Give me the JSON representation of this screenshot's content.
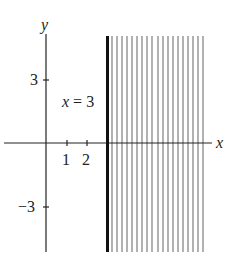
{
  "figure": {
    "axis_labels": {
      "x": "x",
      "y": "y"
    },
    "x_ticks": [
      {
        "value": 1,
        "label": "1"
      },
      {
        "value": 2,
        "label": "2"
      }
    ],
    "y_ticks": [
      {
        "value": 3,
        "label": "3"
      },
      {
        "value": -3,
        "label": "−3"
      }
    ],
    "boundary_line": {
      "equation_label": "x = 3",
      "x_value": 3,
      "style": "solid-thick"
    },
    "shaded_region": {
      "description": "x >= 3",
      "hatch": "vertical-lines",
      "line_count": 19
    },
    "colors": {
      "axis": "#222222",
      "boundary": "#111111",
      "hatch": "#888888",
      "background": "#ffffff"
    }
  }
}
